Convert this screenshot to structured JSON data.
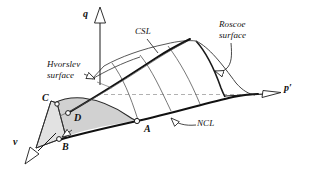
{
  "figure": {
    "background_color": "#ffffff",
    "ink_color": "#111111",
    "shade_color": "#c9c9c9",
    "dashed_color": "#a8a8a8"
  },
  "axes": [
    {
      "name": "q-axis",
      "label": "q",
      "direction": "up",
      "arrow": "hollow-triangle"
    },
    {
      "name": "p-axis",
      "label": "p′",
      "direction": "right",
      "arrow": "hollow-triangle"
    },
    {
      "name": "v-axis",
      "label": "v",
      "direction": "down-left",
      "arrow": "hollow-triangle"
    }
  ],
  "annotations": [
    {
      "name": "csl",
      "line1": "CSL",
      "line2": "",
      "leader": "straight"
    },
    {
      "name": "roscoe-surface",
      "line1": "Roscoe",
      "line2": "surface",
      "leader": "curved-hollow-arrow"
    },
    {
      "name": "hvorslev-surface",
      "line1": "Hvorslev",
      "line2": "surface",
      "leader": "straight-hollow-arrow"
    },
    {
      "name": "ncl",
      "line1": "NCL",
      "line2": "",
      "leader": "curved-hollow-arrow"
    }
  ],
  "points": [
    {
      "name": "point-a",
      "label": "A",
      "x": 137,
      "y": 121
    },
    {
      "name": "point-b",
      "label": "B",
      "x": 58,
      "y": 139
    },
    {
      "name": "point-c",
      "label": "C",
      "x": 52,
      "y": 101
    },
    {
      "name": "point-d",
      "label": "D",
      "x": 71,
      "y": 114
    }
  ],
  "labels": {
    "q": "q",
    "p": "p′",
    "v": "v",
    "csl": "CSL",
    "roscoe_1": "Roscoe",
    "roscoe_2": "surface",
    "hvorslev_1": "Hvorslev",
    "hvorslev_2": "surface",
    "ncl": "NCL",
    "A": "A",
    "B": "B",
    "C": "C",
    "D": "D"
  }
}
